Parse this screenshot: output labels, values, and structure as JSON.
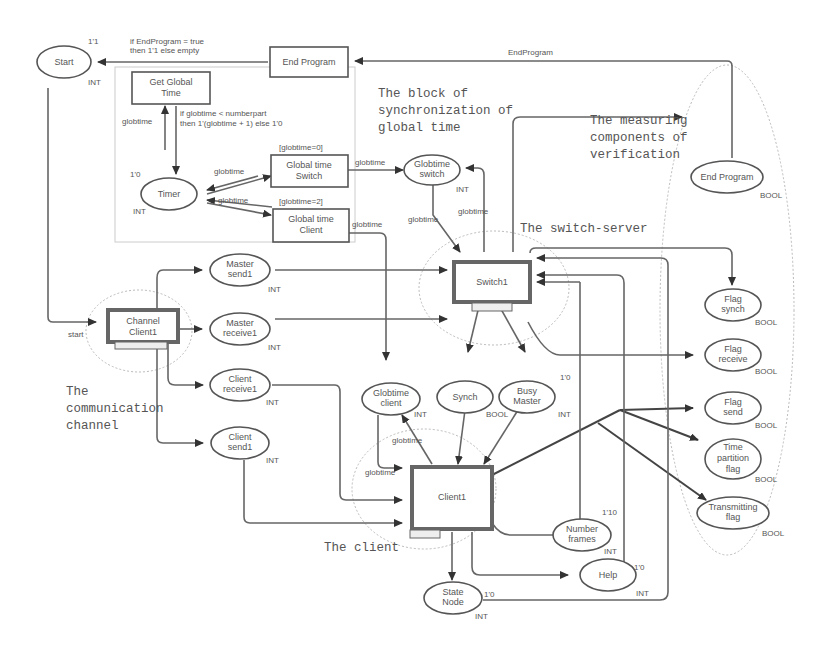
{
  "annotations": {
    "sync_block": [
      "The block of",
      "synchronization of",
      "global time"
    ],
    "measuring": [
      "The measuring",
      "components of",
      "verification"
    ],
    "switch_server": "The switch-server",
    "comm_channel": [
      "The",
      "communication",
      "channel"
    ],
    "client": "The client"
  },
  "places": {
    "start": {
      "label": "Start",
      "type": "INT",
      "marking": "1'1"
    },
    "timer": {
      "label": "Timer",
      "type": "INT",
      "marking": "1'0"
    },
    "globtime_switch": {
      "label": [
        "Globtime",
        "switch"
      ],
      "type": "INT"
    },
    "end_program": {
      "label": "End Program",
      "type": "BOOL"
    },
    "master_send1": {
      "label": [
        "Master",
        "send1"
      ],
      "type": "INT"
    },
    "master_receive1": {
      "label": [
        "Master",
        "receive1"
      ],
      "type": "INT"
    },
    "client_receive1": {
      "label": [
        "Client",
        "receive1"
      ],
      "type": "INT"
    },
    "client_send1": {
      "label": [
        "Client",
        "send1"
      ],
      "type": "INT"
    },
    "globtime_client": {
      "label": [
        "Globtime",
        "client"
      ],
      "type": "INT"
    },
    "synch": {
      "label": "Synch",
      "type": "BOOL"
    },
    "busy_master": {
      "label": [
        "Busy",
        "Master"
      ],
      "type": "INT",
      "marking": "1'0"
    },
    "flag_synch": {
      "label": [
        "Flag",
        "synch"
      ],
      "type": "BOOL"
    },
    "flag_receive": {
      "label": [
        "Flag",
        "receive"
      ],
      "type": "BOOL"
    },
    "flag_send": {
      "label": [
        "Flag",
        "send"
      ],
      "type": "BOOL"
    },
    "time_partition_flag": {
      "label": [
        "Time",
        "partition",
        "flag"
      ],
      "type": "BOOL"
    },
    "transmitting_flag": {
      "label": [
        "Transmitting",
        "flag"
      ],
      "type": "BOOL"
    },
    "number_frames": {
      "label": [
        "Number",
        "frames"
      ],
      "type": "INT",
      "marking": "1'10"
    },
    "help": {
      "label": "Help",
      "type": "INT",
      "marking": "1'0"
    },
    "state_node": {
      "label": [
        "State",
        "Node"
      ],
      "type": "INT",
      "marking": "1'0"
    }
  },
  "transitions": {
    "end_program": {
      "label": "End Program"
    },
    "get_global_time": {
      "label": [
        "Get Global",
        "Time"
      ]
    },
    "global_time_switch": {
      "label": [
        "Global time",
        "Switch"
      ],
      "guard": "[globtime=0]"
    },
    "global_time_client": {
      "label": [
        "Global time",
        "Client"
      ],
      "guard": "[globtime=2]"
    },
    "switch1": {
      "label": "Switch1",
      "tag": "Switch1"
    },
    "channel_client1": {
      "label": [
        "Channel",
        "Client1"
      ],
      "tag": "Channel1"
    },
    "client1": {
      "label": "Client1",
      "tag": "Client"
    }
  },
  "arcs": {
    "end_to_start": [
      "if EndProgram = true",
      "then 1'1 else empty"
    ],
    "endprogram": "EndProgram",
    "timer_inscription": [
      "if globtime < numberpart",
      "then 1'(globtime + 1) else 1'0"
    ],
    "globtime": "globtime",
    "start_port": "start"
  }
}
